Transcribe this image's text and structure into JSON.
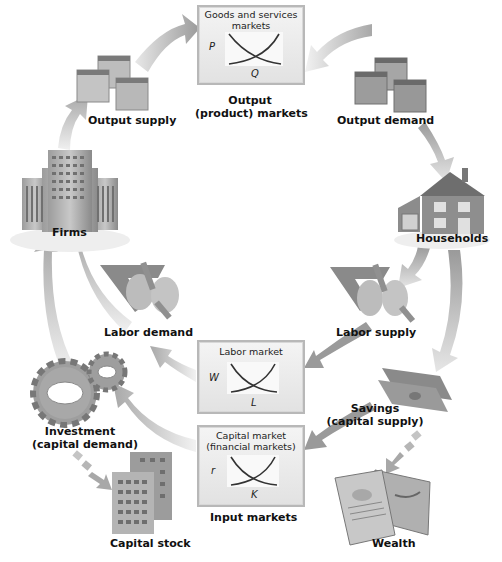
{
  "diagram": {
    "nodes": {
      "output_supply": "Output supply",
      "output_markets": {
        "label_line1": "Output",
        "label_line2": "(product) markets"
      },
      "output_demand": "Output demand",
      "firms": "Firms",
      "households": "Households",
      "labor_demand": "Labor demand",
      "labor_supply": "Labor supply",
      "investment": {
        "label_line1": "Investment",
        "label_line2": "(capital demand)"
      },
      "savings": {
        "label_line1": "Savings",
        "label_line2": "(capital supply)"
      },
      "input_markets": "Input markets",
      "capital_stock": "Capital stock",
      "wealth": "Wealth"
    },
    "market_boxes": {
      "goods": {
        "title_line1": "Goods and services",
        "title_line2": "markets",
        "y_axis": "P",
        "x_axis": "Q"
      },
      "labor": {
        "title_line1": "Labor market",
        "y_axis": "W",
        "x_axis": "L"
      },
      "capital": {
        "title_line1": "Capital market",
        "title_line2": "(financial markets)",
        "y_axis": "r",
        "x_axis": "K"
      }
    }
  }
}
